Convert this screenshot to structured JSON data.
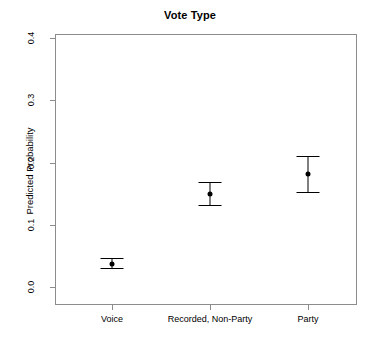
{
  "chart_data": {
    "type": "scatter",
    "title": "Vote Type",
    "xlabel": "",
    "ylabel": "Predicted Probability",
    "categories": [
      "Voice",
      "Recorded, Non-Party",
      "Party"
    ],
    "values": [
      0.037,
      0.149,
      0.181
    ],
    "ci_lower": [
      0.03,
      0.132,
      0.152
    ],
    "ci_upper": [
      0.046,
      0.168,
      0.211
    ],
    "ylim": [
      0.0,
      0.41
    ],
    "yticks": [
      "0.0",
      "0.1",
      "0.2",
      "0.3",
      "0.4"
    ],
    "ytick_values": [
      0.0,
      0.1,
      0.2,
      0.3,
      0.4
    ],
    "grid": false,
    "legend": "none",
    "series": [
      {
        "name": "Predicted Probability",
        "values": [
          0.037,
          0.149,
          0.181
        ],
        "ci_lower": [
          0.03,
          0.132,
          0.152
        ],
        "ci_upper": [
          0.046,
          0.168,
          0.211
        ]
      }
    ],
    "point_color": "#000000",
    "errorbar_color": "#000000",
    "frame_color": "#8c8c8c"
  }
}
